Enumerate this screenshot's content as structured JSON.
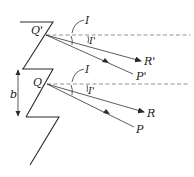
{
  "diagram": {
    "type": "geometric-optics / grating reflection diagram",
    "labels": {
      "q_prime": "Q'",
      "q": "Q",
      "incidence_upper": "I",
      "reflection_upper": "I'",
      "incidence_lower": "I",
      "reflection_lower": "I'",
      "r_prime": "R'",
      "p_prime": "P'",
      "r": "R",
      "p": "P",
      "spacing": "b"
    },
    "colors": {
      "stroke": "#2a2a2a",
      "dashed": "#777777",
      "background": "#ffffff"
    },
    "points": {
      "Q_prime": [
        46,
        35
      ],
      "Q": [
        47,
        84
      ],
      "R_prime_end": [
        140,
        60
      ],
      "P_prime_end": [
        133,
        73
      ],
      "R_end": [
        143,
        111
      ],
      "P_end": [
        133,
        126
      ]
    }
  }
}
